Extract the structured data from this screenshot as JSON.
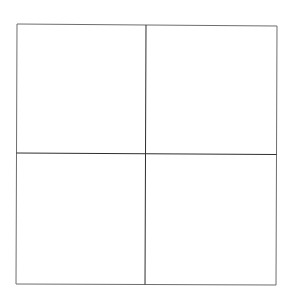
{
  "diagram": {
    "type": "2x2-grid",
    "background": "#ffffff",
    "outer_stroke": "#6e6e6e",
    "divider_stroke": "#2e2e2e",
    "stroke_width": 1,
    "outer_box": {
      "top_left": [
        17,
        24
      ],
      "top_right": [
        277,
        26
      ],
      "bottom_right": [
        276,
        285
      ],
      "bottom_left": [
        16,
        284
      ]
    },
    "vertical_divider": {
      "top": [
        146,
        25
      ],
      "bottom": [
        145,
        284.5
      ]
    },
    "horizontal_divider": {
      "left": [
        16.5,
        153
      ],
      "right": [
        276.5,
        154.5
      ]
    },
    "cells": [
      {
        "id": "top-left",
        "label": ""
      },
      {
        "id": "top-right",
        "label": ""
      },
      {
        "id": "bottom-left",
        "label": ""
      },
      {
        "id": "bottom-right",
        "label": ""
      }
    ]
  }
}
